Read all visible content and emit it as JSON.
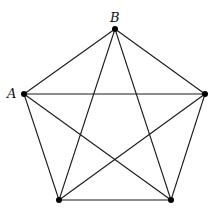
{
  "diagram": {
    "type": "complete-graph-K5",
    "vertices": [
      {
        "id": "B",
        "label": "B",
        "x": 115,
        "y": 29,
        "label_x": 110,
        "label_y": 22
      },
      {
        "id": "A",
        "label": "A",
        "x": 24,
        "y": 94,
        "label_x": 7,
        "label_y": 98
      },
      {
        "id": "R",
        "label": "",
        "x": 205,
        "y": 94
      },
      {
        "id": "BL",
        "label": "",
        "x": 59,
        "y": 200
      },
      {
        "id": "BR",
        "label": "",
        "x": 171,
        "y": 200
      }
    ],
    "edges": [
      [
        "B",
        "A"
      ],
      [
        "B",
        "R"
      ],
      [
        "B",
        "BL"
      ],
      [
        "B",
        "BR"
      ],
      [
        "A",
        "R"
      ],
      [
        "A",
        "BL"
      ],
      [
        "A",
        "BR"
      ],
      [
        "R",
        "BL"
      ],
      [
        "R",
        "BR"
      ],
      [
        "BL",
        "BR"
      ]
    ],
    "colors": {
      "edge": "#1a1a1a",
      "vertex": "#000000",
      "background": "#ffffff"
    }
  }
}
